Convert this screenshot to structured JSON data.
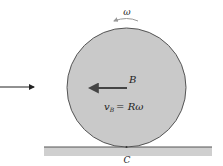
{
  "diagram": {
    "labels": {
      "omega": "ω",
      "center_point": "B",
      "velocity_symbol": "v",
      "velocity_subscript": "B",
      "velocity_equation_rhs": "= Rω",
      "contact_point": "C"
    },
    "elements": {
      "disk": {
        "cx": 126.5,
        "cy": 87.5,
        "r": 59.5,
        "fill": "#c9c9c9",
        "stroke": "#555555"
      },
      "ground": {
        "x": 44,
        "y": 147,
        "width": 168,
        "height": 9,
        "fill": "#cfcfcf",
        "stroke": "#555555"
      },
      "velocity_arrow": {
        "from": [
          127,
          88
        ],
        "to": [
          88,
          88
        ],
        "color": "#444444"
      },
      "external_arrow": {
        "from": [
          0,
          87
        ],
        "to": [
          36,
          87
        ],
        "color": "#222222"
      },
      "rotation_arrow": {
        "direction": "counterclockwise",
        "color": "#999999"
      }
    }
  }
}
